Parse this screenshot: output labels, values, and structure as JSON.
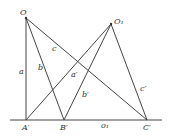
{
  "diagram": {
    "points": {
      "O": {
        "label": "O",
        "x": 26,
        "y": 18
      },
      "O1": {
        "label": "O₁",
        "x": 111,
        "y": 24
      },
      "A_prime": {
        "label": "A′",
        "x": 26,
        "y": 120
      },
      "B_prime": {
        "label": "B′",
        "x": 64,
        "y": 120
      },
      "C_prime": {
        "label": "C′",
        "x": 147,
        "y": 120
      }
    },
    "baseline": {
      "x1": 10,
      "x2": 162,
      "y": 120,
      "label": "o₁"
    },
    "segment_labels": {
      "a": "a",
      "b": "b",
      "c": "c",
      "a_prime": "a′",
      "b_prime": "b′",
      "c_prime": "c′"
    }
  }
}
